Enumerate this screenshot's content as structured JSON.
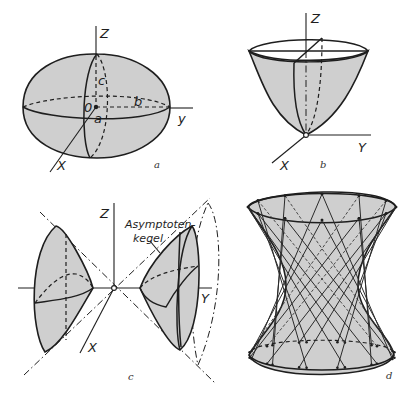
{
  "figure": {
    "colors": {
      "surface_fill": "#cfcfcf",
      "line": "#1e1e1e",
      "background": "#ffffff"
    },
    "panels": [
      {
        "id": "a",
        "label": "a",
        "surface": "ellipsoid",
        "axis_labels": {
          "x": "X",
          "y": "y",
          "z": "Z"
        },
        "origin_label": "0",
        "semi_axis_labels": {
          "a": "a",
          "b": "b",
          "c": "c"
        }
      },
      {
        "id": "b",
        "label": "b",
        "surface": "elliptic paraboloid",
        "axis_labels": {
          "x": "X",
          "y": "Y",
          "z": "Z"
        }
      },
      {
        "id": "c",
        "label": "c",
        "surface": "hyperboloid of two sheets",
        "axis_labels": {
          "x": "X",
          "y": "Y",
          "z": "Z"
        },
        "annotation": {
          "line1": "Asymptoten-",
          "line2": "kegel"
        }
      },
      {
        "id": "d",
        "label": "d",
        "surface": "hyperboloid of one sheet (ruled)"
      }
    ]
  }
}
